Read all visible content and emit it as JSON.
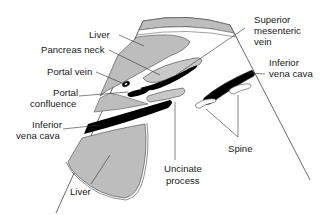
{
  "diagram": {
    "type": "anatomical-cross-section",
    "colors": {
      "liver_fill": "#bdbdbd",
      "pancreas_fill": "#c8c8c8",
      "vessel_fill": "#000000",
      "outline": "#444444",
      "background": "#ffffff",
      "text": "#1a1a1a"
    },
    "labels": {
      "liver_top": "Liver",
      "pancreas_neck": "Pancreas neck",
      "portal_vein": "Portal vein",
      "portal_confluence_1": "Portal",
      "portal_confluence_2": "confluence",
      "ivc_left_1": "Inferior",
      "ivc_left_2": "vena cava",
      "liver_bottom": "Liver",
      "smv_1": "Superior",
      "smv_2": "mesenteric",
      "smv_3": "vein",
      "ivc_right_1": "Inferior",
      "ivc_right_2": "vena cava",
      "spine": "Spine",
      "uncinate_1": "Uncinate",
      "uncinate_2": "process"
    }
  }
}
